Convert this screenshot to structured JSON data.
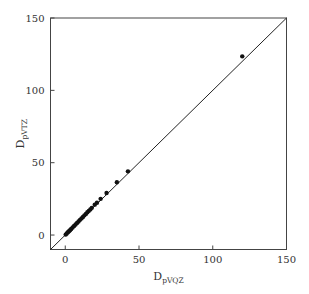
{
  "chart_data": {
    "type": "scatter",
    "title": "",
    "xlabel": "D",
    "xlabel_sub": "pVQZ",
    "ylabel": "D",
    "ylabel_sub": "pVTZ",
    "xlim": [
      -10,
      150
    ],
    "ylim": [
      -10,
      150
    ],
    "xticks": [
      0,
      50,
      100,
      150
    ],
    "yticks": [
      0,
      50,
      100,
      150
    ],
    "grid": false,
    "legend": null,
    "reference_line": {
      "type": "y=x",
      "from": [
        -10,
        -10
      ],
      "to": [
        150,
        150
      ]
    },
    "series": [
      {
        "name": "points",
        "x": [
          0.3,
          1.0,
          1.8,
          2.5,
          3.2,
          4.0,
          5.0,
          6.0,
          7.0,
          8.0,
          9.0,
          10.0,
          11.0,
          12.0,
          13.0,
          14.0,
          15.0,
          16.0,
          17.0,
          18.0,
          20.0,
          21.5,
          24.0,
          28.0,
          35.0,
          42.5,
          120.0
        ],
        "y": [
          0.3,
          1.1,
          1.9,
          2.6,
          3.3,
          4.2,
          5.2,
          6.3,
          7.3,
          8.4,
          9.4,
          10.5,
          11.5,
          12.5,
          13.6,
          14.6,
          15.7,
          16.7,
          17.7,
          18.8,
          21.0,
          22.3,
          25.0,
          29.0,
          36.5,
          44.0,
          123.5
        ]
      }
    ]
  }
}
